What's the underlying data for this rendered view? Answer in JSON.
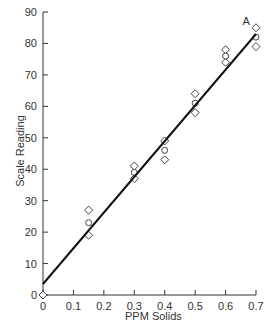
{
  "chart_data": {
    "type": "scatter",
    "title": "",
    "xlabel": "PPM Solids",
    "ylabel": "Scale Reading",
    "xlim": [
      0,
      0.7
    ],
    "ylim": [
      0,
      90
    ],
    "xticks": [
      "0",
      "0.1",
      "0.2",
      "0.3",
      "0.4",
      "0.5",
      "0.6",
      "0.7"
    ],
    "yticks": [
      "0",
      "10",
      "20",
      "30",
      "40",
      "50",
      "60",
      "70",
      "80",
      "90"
    ],
    "grid": false,
    "annotation": "A",
    "series": [
      {
        "name": "diamonds",
        "marker": "diamond",
        "points": [
          [
            0,
            0
          ],
          [
            0.15,
            27
          ],
          [
            0.15,
            19
          ],
          [
            0.3,
            41
          ],
          [
            0.3,
            37
          ],
          [
            0.4,
            49
          ],
          [
            0.4,
            43
          ],
          [
            0.5,
            64
          ],
          [
            0.5,
            58
          ],
          [
            0.6,
            78
          ],
          [
            0.6,
            74
          ],
          [
            0.7,
            85
          ],
          [
            0.7,
            79
          ]
        ]
      },
      {
        "name": "circles",
        "marker": "circle",
        "points": [
          [
            0.15,
            23
          ],
          [
            0.3,
            39
          ],
          [
            0.4,
            46
          ],
          [
            0.5,
            61
          ],
          [
            0.6,
            76
          ],
          [
            0.7,
            82
          ]
        ]
      },
      {
        "name": "fit line",
        "type": "line",
        "points": [
          [
            0,
            3.5
          ],
          [
            0.7,
            83
          ]
        ]
      }
    ]
  }
}
